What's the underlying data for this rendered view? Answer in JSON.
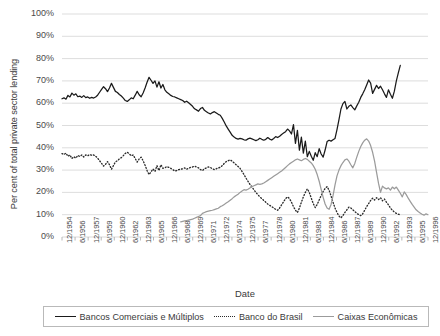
{
  "chart_data": {
    "type": "line",
    "title": "",
    "xlabel": "Date",
    "ylabel": "Per cent of total private sector lending",
    "ylim": [
      0,
      100
    ],
    "ytick_labels": [
      "0%",
      "10%",
      "20%",
      "30%",
      "40%",
      "50%",
      "60%",
      "70%",
      "80%",
      "90%",
      "100%"
    ],
    "ytick_values": [
      0,
      10,
      20,
      30,
      40,
      50,
      60,
      70,
      80,
      90,
      100
    ],
    "grid": true,
    "legend_position": "bottom",
    "x_tick_labels": [
      "12/1954",
      "6/1956",
      "12/1957",
      "6/1959",
      "12/1960",
      "6/1962",
      "12/1963",
      "6/1965",
      "12/1966",
      "6/1968",
      "12/1969",
      "6/1971",
      "12/1972",
      "6/1974",
      "12/1975",
      "6/1977",
      "12/1978",
      "6/1980",
      "12/1981",
      "6/1983",
      "12/1984",
      "6/1986",
      "12/1987",
      "6/1989",
      "12/1990",
      "6/1992",
      "12/1993",
      "6/1995",
      "12/1996"
    ],
    "series": [
      {
        "name": "Bancos Comerciais e Múltiplos",
        "style": "solid",
        "color": "#1a1a1a",
        "values": [
          62,
          62.4,
          61.8,
          63.5,
          62.8,
          64.5,
          63.6,
          64.2,
          62.9,
          63.2,
          62.6,
          63.4,
          62.5,
          62.8,
          62.2,
          62.6,
          62.3,
          62.8,
          63.6,
          64.9,
          66.2,
          67.4,
          66.5,
          65.2,
          66.8,
          68.9,
          67.1,
          65.3,
          64.8,
          63.9,
          63.2,
          62.3,
          61.2,
          60.8,
          61.5,
          62.4,
          62.0,
          63.6,
          65.3,
          63.8,
          62.9,
          64.6,
          66.8,
          69.4,
          71.6,
          70.3,
          68.9,
          70.0,
          67.2,
          69.6,
          66.8,
          68.4,
          66.0,
          64.9,
          64.2,
          63.5,
          63.0,
          62.8,
          62.4,
          62.0,
          61.6,
          61.2,
          60.4,
          60.9,
          60.2,
          59.4,
          58.6,
          57.5,
          57.0,
          56.4,
          57.6,
          58.1,
          56.8,
          56.2,
          55.6,
          55.2,
          55.8,
          56.2,
          55.6,
          55.0,
          54.6,
          53.2,
          51.6,
          49.8,
          48.4,
          47.0,
          45.6,
          44.8,
          44.2,
          43.9,
          44.2,
          44.0,
          43.6,
          43.4,
          44.0,
          44.3,
          44.0,
          43.6,
          43.2,
          43.6,
          44.3,
          43.8,
          43.4,
          43.8,
          44.6,
          43.9,
          43.5,
          44.2,
          45.0,
          44.6,
          45.2,
          46.0,
          46.6,
          47.2,
          48.4,
          47.6,
          46.2,
          50.4,
          42.0,
          47.8,
          38.9,
          44.8,
          37.6,
          43.0,
          36.0,
          38.4,
          36.2,
          34.4,
          37.8,
          36.0,
          39.6,
          37.2,
          35.8,
          39.0,
          42.8,
          43.4,
          43.0,
          43.6,
          44.2,
          48.2,
          52.6,
          57.4,
          59.8,
          60.8,
          57.4,
          58.6,
          59.2,
          58.0,
          57.0,
          58.8,
          60.4,
          62.6,
          64.2,
          66.0,
          68.2,
          70.4,
          69.0,
          64.4,
          66.2,
          68.0,
          66.6,
          67.6,
          66.0,
          64.2,
          62.6,
          66.0,
          64.0,
          62.2,
          65.4,
          70.0,
          73.6,
          77.0
        ]
      },
      {
        "name": "Banco do Brasil",
        "style": "dotted",
        "color": "#2b2b2b",
        "values": [
          37.4,
          37.0,
          37.6,
          36.2,
          36.8,
          35.2,
          36.0,
          35.4,
          36.6,
          36.1,
          36.8,
          35.9,
          36.8,
          36.4,
          37.0,
          36.6,
          36.8,
          36.2,
          35.4,
          34.2,
          33.0,
          31.8,
          32.6,
          33.8,
          32.4,
          30.4,
          32.0,
          33.7,
          34.2,
          35.0,
          35.6,
          36.5,
          37.5,
          38.0,
          37.3,
          36.4,
          36.8,
          35.2,
          33.6,
          35.0,
          35.8,
          34.2,
          32.2,
          29.8,
          28.0,
          29.2,
          30.5,
          29.4,
          32.0,
          29.8,
          32.4,
          30.8,
          31.0,
          31.6,
          31.2,
          30.8,
          30.2,
          29.6,
          29.8,
          30.2,
          30.4,
          30.6,
          31.0,
          30.4,
          30.8,
          31.2,
          31.4,
          31.8,
          31.4,
          31.0,
          30.2,
          29.8,
          30.6,
          31.0,
          31.4,
          31.2,
          30.6,
          30.2,
          30.6,
          31.0,
          31.2,
          32.0,
          33.0,
          33.8,
          34.2,
          34.6,
          34.0,
          33.2,
          32.4,
          31.6,
          30.8,
          29.4,
          28.0,
          26.4,
          25.0,
          23.6,
          22.4,
          21.2,
          20.0,
          19.0,
          18.0,
          17.2,
          16.4,
          15.6,
          14.8,
          14.2,
          13.6,
          13.0,
          12.4,
          12.0,
          13.0,
          14.4,
          15.8,
          17.2,
          18.0,
          17.2,
          15.6,
          13.6,
          12.0,
          11.0,
          13.0,
          15.6,
          18.0,
          20.0,
          21.6,
          20.0,
          17.4,
          15.0,
          13.2,
          14.6,
          16.6,
          18.6,
          20.4,
          21.8,
          22.6,
          21.0,
          18.4,
          15.6,
          13.0,
          11.0,
          9.4,
          8.6,
          9.6,
          11.0,
          12.2,
          13.4,
          13.0,
          12.2,
          11.4,
          10.6,
          10.0,
          9.6,
          10.4,
          12.0,
          13.6,
          15.0,
          16.4,
          17.4,
          16.6,
          17.6,
          16.8,
          17.6,
          16.2,
          17.0,
          15.6,
          14.4,
          13.0,
          12.0,
          11.2,
          10.6,
          10.2,
          10.0
        ]
      },
      {
        "name": "Caixas Econômicas",
        "style": "solid",
        "color": "#9b9b9b",
        "start_index": 60,
        "values": [
          6.8,
          7.0,
          7.2,
          7.4,
          7.6,
          7.8,
          8.0,
          8.4,
          8.8,
          9.2,
          9.6,
          10.6,
          11.0,
          11.4,
          11.6,
          11.8,
          12.0,
          12.3,
          12.6,
          12.9,
          13.6,
          14.0,
          14.6,
          15.2,
          15.8,
          16.5,
          17.2,
          18.0,
          18.6,
          19.2,
          20.0,
          20.6,
          21.2,
          21.0,
          21.4,
          22.0,
          22.6,
          23.0,
          23.4,
          23.8,
          23.6,
          23.8,
          24.2,
          24.8,
          25.4,
          26.0,
          26.6,
          27.2,
          27.8,
          28.4,
          29.0,
          29.6,
          30.4,
          31.2,
          32.0,
          32.8,
          33.4,
          34.0,
          34.6,
          35.0,
          34.6,
          34.2,
          34.8,
          35.2,
          34.8,
          34.0,
          33.2,
          32.0,
          30.4,
          28.0,
          25.0,
          21.4,
          17.8,
          14.8,
          13.0,
          12.4,
          14.6,
          18.6,
          23.4,
          27.4,
          30.0,
          32.0,
          33.4,
          34.6,
          35.0,
          34.0,
          32.4,
          31.0,
          33.0,
          35.8,
          38.4,
          40.6,
          42.2,
          43.4,
          44.0,
          43.0,
          41.0,
          38.0,
          34.0,
          29.0,
          24.0,
          20.0,
          22.8,
          22.0,
          21.6,
          22.0,
          21.0,
          22.4,
          21.6,
          22.4,
          21.0,
          19.6,
          18.0,
          20.2,
          19.0,
          17.4,
          16.0,
          14.6,
          13.4,
          12.2,
          11.4,
          10.8,
          10.2,
          9.8,
          10.4,
          10.0
        ]
      }
    ]
  },
  "legend": {
    "entries": [
      {
        "label": "Bancos Comerciais e Múltiplos",
        "style": "solid",
        "color": "#1a1a1a"
      },
      {
        "label": "Banco do Brasil",
        "style": "dotted",
        "color": "#2b2b2b"
      },
      {
        "label": "Caixas Econômicas",
        "style": "solid",
        "color": "#9b9b9b"
      }
    ]
  },
  "colors": {
    "grid": "#d9d9d9",
    "axis": "#b0b0b0",
    "text": "#3a3a3a",
    "series_1": "#1a1a1a",
    "series_2": "#2b2b2b",
    "series_3": "#9b9b9b"
  }
}
